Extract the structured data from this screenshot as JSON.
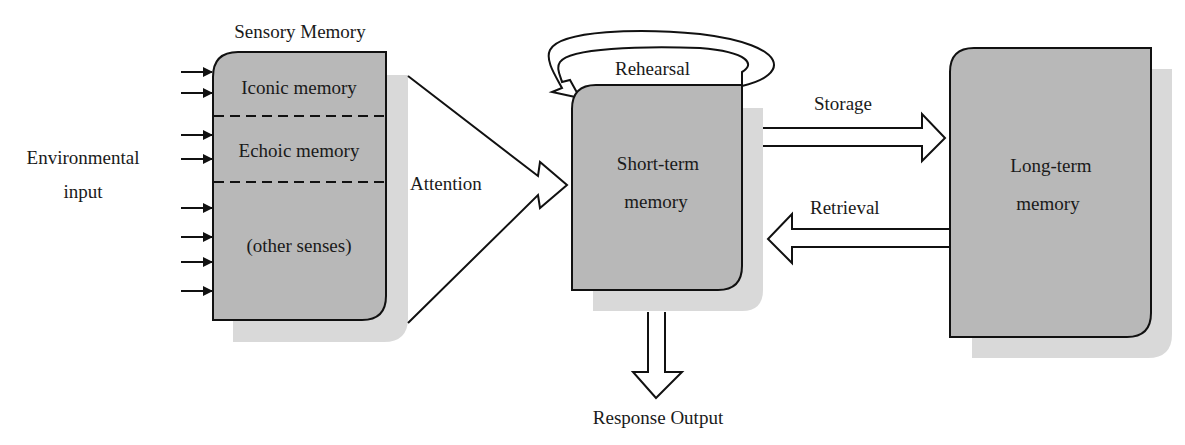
{
  "diagram": {
    "type": "flow",
    "nodes": {
      "environmental_input": "Environmental\ninput",
      "sensory_memory": {
        "title": "Sensory Memory",
        "sections": [
          "Iconic memory",
          "Echoic memory",
          "(other senses)"
        ]
      },
      "short_term_memory": [
        "Short-term",
        "memory"
      ],
      "long_term_memory": [
        "Long-term",
        "memory"
      ],
      "response_output": "Response Output"
    },
    "edges": {
      "attention": "Attention",
      "rehearsal": "Rehearsal",
      "storage": "Storage",
      "retrieval": "Retrieval"
    },
    "input_arrow_count": 8
  },
  "colors": {
    "box_fill": "#b8b8b8",
    "shadow": "#d9d9d9",
    "stroke": "#111111"
  }
}
